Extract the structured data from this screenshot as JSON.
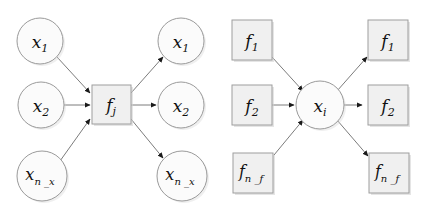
{
  "figure": {
    "background_color": "#ffffff",
    "node_fill_circle": "#fbfbfb",
    "node_fill_box": "#f0f0f0",
    "node_stroke": "#9a9a9a",
    "edge_color": "#7c7c7c",
    "arrow_color": "#1a1a1a",
    "label_color": "#111111"
  },
  "panels": [
    {
      "id": "factor-node-panel",
      "center_node": {
        "shape": "square",
        "base": "f",
        "subscript": "j",
        "label": "f_j",
        "cx": 111.5,
        "cy": 104.5,
        "size": 39
      },
      "inputs": [
        {
          "shape": "circle",
          "base": "x",
          "subscript": "1",
          "label": "x_1",
          "cx": 40,
          "cy": 41,
          "r": 23
        },
        {
          "shape": "circle",
          "base": "x",
          "subscript": "2",
          "label": "x_2",
          "cx": 41,
          "cy": 105,
          "r": 23
        },
        {
          "shape": "circle",
          "base": "x",
          "subscript": "n_x",
          "label": "x_n_x",
          "cx": 42,
          "cy": 176,
          "r": 25
        }
      ],
      "outputs": [
        {
          "shape": "circle",
          "base": "x",
          "subscript": "1",
          "label": "x_1",
          "cx": 181,
          "cy": 41,
          "r": 23
        },
        {
          "shape": "circle",
          "base": "x",
          "subscript": "2",
          "label": "x_2",
          "cx": 181,
          "cy": 105,
          "r": 23
        },
        {
          "shape": "circle",
          "base": "x",
          "subscript": "n_x",
          "label": "x_n_x",
          "cx": 182,
          "cy": 176,
          "r": 25
        }
      ]
    },
    {
      "id": "variable-node-panel",
      "center_node": {
        "shape": "circle",
        "base": "x",
        "subscript": "i",
        "label": "x_i",
        "cx": 320,
        "cy": 105,
        "r": 24
      },
      "inputs": [
        {
          "shape": "square",
          "base": "f",
          "subscript": "1",
          "label": "f_1",
          "cx": 252,
          "cy": 40,
          "size": 40
        },
        {
          "shape": "square",
          "base": "f",
          "subscript": "2",
          "label": "f_2",
          "cx": 252,
          "cy": 105,
          "size": 40
        },
        {
          "shape": "square",
          "base": "f",
          "subscript": "n_f",
          "label": "f_n_f",
          "cx": 253,
          "cy": 173,
          "size": 40
        }
      ],
      "outputs": [
        {
          "shape": "square",
          "base": "f",
          "subscript": "1",
          "label": "f_1",
          "cx": 388,
          "cy": 40,
          "size": 40
        },
        {
          "shape": "square",
          "base": "f",
          "subscript": "2",
          "label": "f_2",
          "cx": 388,
          "cy": 105,
          "size": 40
        },
        {
          "shape": "square",
          "base": "f",
          "subscript": "n_f",
          "label": "f_n_f",
          "cx": 389,
          "cy": 173,
          "size": 40
        }
      ]
    }
  ],
  "labels": {
    "x_1": {
      "base": "x",
      "sub": "1"
    },
    "x_2": {
      "base": "x",
      "sub": "2"
    },
    "x_n_x": {
      "base": "x",
      "sub": "n _x"
    },
    "x_i": {
      "base": "x",
      "sub": "i"
    },
    "f_j": {
      "base": "f",
      "sub": "j"
    },
    "f_1": {
      "base": "f",
      "sub": "1"
    },
    "f_2": {
      "base": "f",
      "sub": "2"
    },
    "f_n_f": {
      "base": "f",
      "sub": "n _f"
    }
  }
}
